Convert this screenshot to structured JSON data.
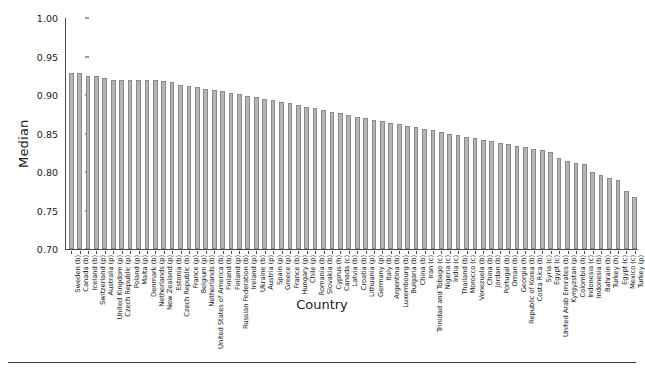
{
  "chart_data": {
    "type": "bar",
    "title": "",
    "xlabel": "Country",
    "ylabel": "Median",
    "ylim": [
      0.7,
      1.0
    ],
    "yticks": [
      0.7,
      0.75,
      0.8,
      0.85,
      0.9,
      0.95,
      1.0
    ],
    "ytick_labels": [
      "0.70",
      "0.75",
      "0.80",
      "0.85",
      "0.90",
      "0.95",
      "1.00"
    ],
    "grid": false,
    "legend": "none",
    "bar_color": "#b5b5b5",
    "bar_edge_color": "#8a8a8a",
    "categories": [
      "Sweden (b)",
      "Canada (b)",
      "Iceland (b)",
      "Switzerland (p)",
      "Australia (p)",
      "United Kingdom (p)",
      "Czech Republic (p)",
      "Poland (p)",
      "Malta (p)",
      "Denmark (b)",
      "Netherlands (p)",
      "New Zealand (p)",
      "Estonia (b)",
      "Czech Republic (b)",
      "France (p)",
      "Belgium (p)",
      "Netherlands (b)",
      "United States of America (b)",
      "Finland (b)",
      "Finland (p)",
      "Russian Federation (b)",
      "Ireland (p)",
      "Ukraine (b)",
      "Austria (p)",
      "Spain (p)",
      "Greece (p)",
      "France (b)",
      "Hungary (p)",
      "Chile (p)",
      "Romania (b)",
      "Slovakia (b)",
      "Cyprus (h)",
      "Canada (c)",
      "Latvia (b)",
      "Croatia (b)",
      "Lithuania (p)",
      "Germany (p)",
      "Italy (b)",
      "Argentina (b)",
      "Luxembourg (b)",
      "Bulgaria (b)",
      "China (b)",
      "Iran (c)",
      "Trinidad and Tobago (c)",
      "Nigeria (c)",
      "India (c)",
      "Thailand (b)",
      "Morocco (c)",
      "Venezuela (b)",
      "China (b)",
      "Jordan (b)",
      "Portugal (b)",
      "Oman (b)",
      "Georgia (h)",
      "Republic of Korea (b)",
      "Costa Rica (b)",
      "Syria (c)",
      "Egypt (c)",
      "United Arab Emirates (b)",
      "Kyrgyzstan (p)",
      "Colombia (h)",
      "Indonesia (c)",
      "Indonesia (b)",
      "Bahrain (b)",
      "Turkey (h)",
      "Egypt (c)",
      "Mexico (c)",
      "Turkey (p)"
    ],
    "values": [
      0.928,
      0.928,
      0.925,
      0.925,
      0.922,
      0.92,
      0.92,
      0.92,
      0.919,
      0.919,
      0.919,
      0.918,
      0.917,
      0.913,
      0.912,
      0.911,
      0.908,
      0.907,
      0.905,
      0.903,
      0.901,
      0.899,
      0.897,
      0.895,
      0.893,
      0.891,
      0.889,
      0.887,
      0.885,
      0.883,
      0.88,
      0.878,
      0.876,
      0.874,
      0.872,
      0.87,
      0.868,
      0.866,
      0.864,
      0.862,
      0.86,
      0.858,
      0.856,
      0.854,
      0.852,
      0.85,
      0.848,
      0.846,
      0.844,
      0.842,
      0.84,
      0.838,
      0.836,
      0.834,
      0.832,
      0.83,
      0.828,
      0.826,
      0.818,
      0.814,
      0.812,
      0.81,
      0.8,
      0.796,
      0.792,
      0.79,
      0.775,
      0.767
    ]
  }
}
